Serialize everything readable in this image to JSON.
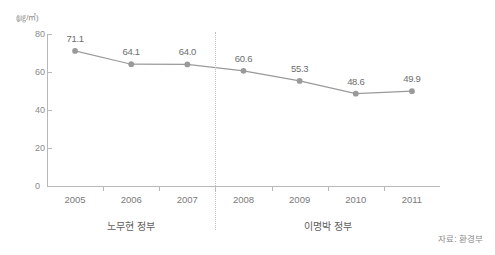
{
  "chart_data": {
    "type": "line",
    "title": "",
    "subtitle": "",
    "xlabel": "",
    "ylabel": "",
    "unit_label": "(㎍/㎥)",
    "categories": [
      "2005",
      "2006",
      "2007",
      "2008",
      "2009",
      "2010",
      "2011"
    ],
    "values": [
      71.1,
      64.1,
      64.0,
      60.6,
      55.3,
      48.6,
      49.9
    ],
    "value_labels": [
      "71.1",
      "64.1",
      "64.0",
      "60.6",
      "55.3",
      "48.6",
      "49.9"
    ],
    "ylim": [
      0,
      80
    ],
    "yticks": [
      0,
      20,
      40,
      60,
      80
    ],
    "ytick_labels": [
      "0",
      "20",
      "40",
      "60",
      "80"
    ],
    "grid": false,
    "legend": false,
    "series": [
      {
        "name": "미세먼지 농도",
        "values": [
          71.1,
          64.1,
          64.0,
          60.6,
          55.3,
          48.6,
          49.9
        ],
        "color": "#9a9a9a",
        "marker": "circle"
      }
    ],
    "annotations": [
      {
        "name": "era-divider",
        "type": "vertical-dotted-line",
        "between": [
          "2007",
          "2008"
        ]
      },
      {
        "name": "era-left",
        "label": "노무현 정부",
        "span": [
          "2005",
          "2007"
        ]
      },
      {
        "name": "era-right",
        "label": "이명박 정부",
        "span": [
          "2008",
          "2011"
        ]
      }
    ],
    "source": "자료: 환경부"
  },
  "eras": [
    {
      "label": "노무현 정부"
    },
    {
      "label": "이명박 정부"
    }
  ],
  "footer": {
    "source": "자료: 환경부"
  }
}
